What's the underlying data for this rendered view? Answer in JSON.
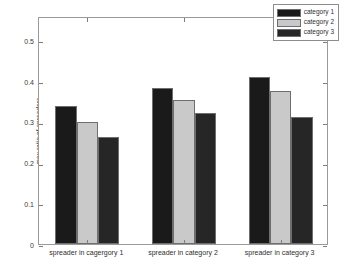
{
  "chart_data": {
    "type": "bar",
    "title": "",
    "xlabel": "",
    "ylabel": "max ratio of spreaders",
    "categories": [
      "spreader in cagergory 1",
      "spreader in category 2",
      "spreader in category 3"
    ],
    "series": [
      {
        "name": "category 1",
        "color": "#1a1a1a",
        "values": [
          0.34,
          0.382,
          0.41
        ]
      },
      {
        "name": "category 2",
        "color": "#c9c9c9",
        "values": [
          0.3,
          0.353,
          0.375
        ]
      },
      {
        "name": "category 3",
        "color": "#262626",
        "values": [
          0.263,
          0.322,
          0.311
        ]
      }
    ],
    "ylim": [
      0,
      0.56
    ],
    "yticks": [
      0,
      0.1,
      0.2,
      0.3,
      0.4,
      0.5
    ],
    "ytick_labels": [
      "0",
      "0.1",
      "0.2",
      "0.3",
      "0.4",
      "0.5"
    ],
    "grid": false,
    "legend_position": "top-right",
    "legend_entries": [
      "category 1",
      "category 2",
      "category 3"
    ]
  }
}
